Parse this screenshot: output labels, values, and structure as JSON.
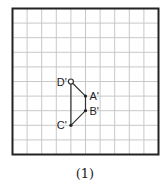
{
  "figure": {
    "caption": "(1)",
    "grid": {
      "cols": 10,
      "rows": 10,
      "line_color": "#c8c8c8",
      "border_color": "#222222"
    },
    "points": [
      {
        "name": "D'",
        "gx": 4,
        "gy": 5,
        "marker": "open-circle",
        "label_side": "left"
      },
      {
        "name": "A'",
        "gx": 5,
        "gy": 6,
        "marker": "dot",
        "label_side": "right"
      },
      {
        "name": "B'",
        "gx": 5,
        "gy": 7,
        "marker": "dot",
        "label_side": "right"
      },
      {
        "name": "C'",
        "gx": 4,
        "gy": 8,
        "marker": "dot",
        "label_side": "left"
      }
    ],
    "segments": [
      [
        "D'",
        "A'"
      ],
      [
        "A'",
        "B'"
      ],
      [
        "B'",
        "C'"
      ],
      [
        "C'",
        "D'"
      ]
    ]
  }
}
